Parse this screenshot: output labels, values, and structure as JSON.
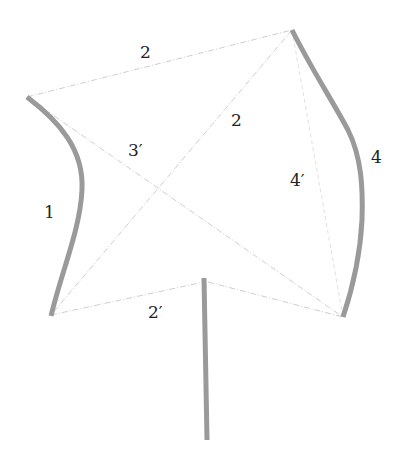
{
  "diagram": {
    "colors": {
      "background": "#ffffff",
      "thick_stroke": "#9a9a9a",
      "thin_line": "#c8c8c8",
      "label_text": "#222222"
    },
    "labels": {
      "top_edge": "2",
      "diagonal_left": "3′",
      "diagonal_right": "2",
      "right_inner": "4′",
      "right_curve": "4",
      "left_curve": "1",
      "bottom_left_edge": "2′"
    },
    "vertices": {
      "top_left": [
        27,
        97
      ],
      "top_right": [
        292,
        30
      ],
      "bottom_left": [
        51,
        315
      ],
      "bottom_right": [
        343,
        317
      ],
      "stem_top": [
        204,
        280
      ],
      "stem_bottom": [
        207,
        440
      ]
    }
  }
}
